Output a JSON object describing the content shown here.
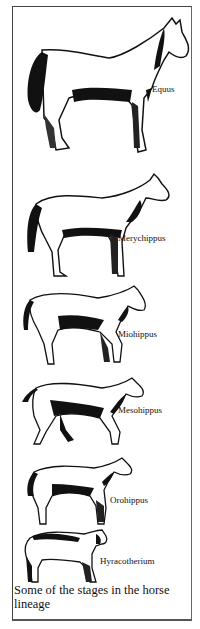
{
  "figure": {
    "caption": "Some of the stages in the horse lineage",
    "stages": [
      {
        "id": "equus",
        "label": "Equus"
      },
      {
        "id": "merychippus",
        "label": "Merychippus"
      },
      {
        "id": "miohippus",
        "label": "Miohippus"
      },
      {
        "id": "mesohippus",
        "label": "Mesohippus"
      },
      {
        "id": "orohippus",
        "label": "Orohippus"
      },
      {
        "id": "hyracotherium",
        "label": "Hyracotherium"
      }
    ]
  },
  "colors": {
    "ink": "#111111",
    "paper": "#ffffff",
    "frame": "#444444"
  }
}
